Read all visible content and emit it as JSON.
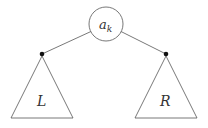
{
  "diagram": {
    "root": {
      "label": "a",
      "subscript": "k"
    },
    "left_subtree": {
      "label": "L"
    },
    "right_subtree": {
      "label": "R"
    },
    "colors": {
      "stroke": "#555555",
      "node_dot": "#111111",
      "background": "#ffffff"
    }
  }
}
